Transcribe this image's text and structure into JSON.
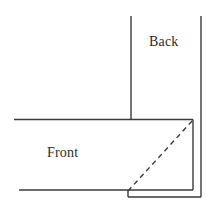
{
  "figure": {
    "background_color": "#ffffff",
    "stroke_color": "#3a3a3a",
    "text_color": "#2b2b2b",
    "width": 212,
    "height": 208
  },
  "labels": {
    "back": "Back",
    "front": "Front"
  },
  "geometry": {
    "solid_lines": [
      {
        "name": "back-left-vertical",
        "x1": 131,
        "y1": 16,
        "x2": 131,
        "y2": 120
      },
      {
        "name": "back-right-vertical",
        "x1": 201,
        "y1": 16,
        "x2": 201,
        "y2": 197
      },
      {
        "name": "front-top-horizontal",
        "x1": 14,
        "y1": 119.5,
        "x2": 193,
        "y2": 119.5
      },
      {
        "name": "front-right-vertical",
        "x1": 193,
        "y1": 119.5,
        "x2": 193,
        "y2": 190
      },
      {
        "name": "front-bottom-horizontal",
        "x1": 19,
        "y1": 190,
        "x2": 193,
        "y2": 190
      },
      {
        "name": "front-bottom-step-vertical",
        "x1": 128,
        "y1": 190,
        "x2": 128,
        "y2": 197
      },
      {
        "name": "base-bottom-horizontal",
        "x1": 128,
        "y1": 197,
        "x2": 201,
        "y2": 197
      }
    ],
    "dashed_lines": [
      {
        "name": "fold-diagonal",
        "x1": 128,
        "y1": 191,
        "x2": 193,
        "y2": 120,
        "dash": "5 4"
      }
    ]
  }
}
